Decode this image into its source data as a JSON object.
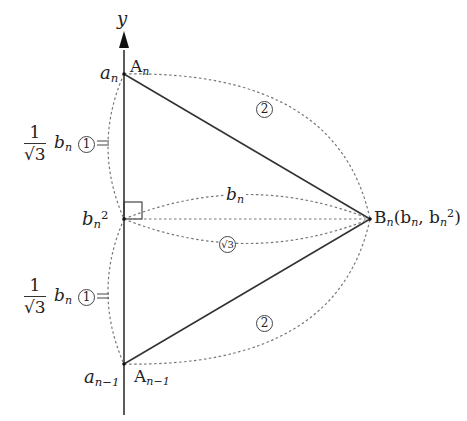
{
  "diagram": {
    "axis": {
      "label": "y"
    },
    "points": {
      "A_n": {
        "label": "A",
        "sub": "n",
        "y_value": "a",
        "y_sub": "n"
      },
      "A_prev": {
        "label": "A",
        "sub": "n−1",
        "y_value": "a",
        "y_sub": "n−1"
      },
      "B_n": {
        "label": "B",
        "sub": "n",
        "coords_prefix": "(b",
        "coords_sub1": "n",
        "coords_mid": ", b",
        "coords_sub2": "n",
        "coords_sup": "2",
        "coords_suffix": ")"
      },
      "mid": {
        "label": "b",
        "sub": "n",
        "sup": "2"
      }
    },
    "segments": {
      "upper_left": {
        "num": "1",
        "den": "√3",
        "var": "b",
        "var_sub": "n",
        "ratio": "1",
        "tick": "="
      },
      "lower_left": {
        "num": "1",
        "den": "√3",
        "var": "b",
        "var_sub": "n",
        "ratio": "1",
        "tick": "="
      },
      "horizontal": {
        "var": "b",
        "var_sub": "n"
      },
      "ratio_horizontal": "√3",
      "ratio_upper_right": "2",
      "ratio_lower_right": "2"
    },
    "colors": {
      "line": "#333333",
      "dotted": "#777777",
      "background": "#ffffff"
    }
  }
}
